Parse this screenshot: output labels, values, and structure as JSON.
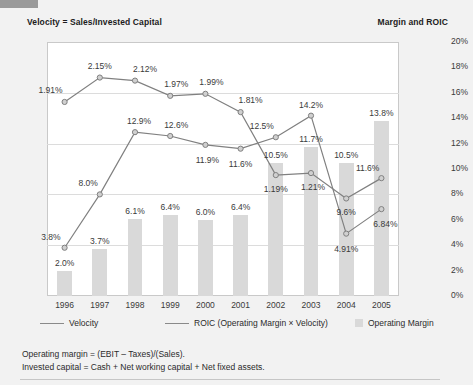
{
  "axis_titles": {
    "left": "Velocity = Sales/Invested Capital",
    "right": "Margin and ROIC"
  },
  "legend": [
    {
      "label": "Velocity",
      "marker": "line"
    },
    {
      "label": "ROIC (Operating Margin × Velocity)",
      "marker": "line"
    },
    {
      "label": "Operating Margin",
      "marker": "swatch"
    }
  ],
  "notes": [
    "Operating margin = (EBIT – Taxes)/(Sales).",
    "Invested capital = Cash + Net working capital + Net fixed assets."
  ],
  "colors": {
    "page_background": "#f2f2f2",
    "plot_background": "#ffffff",
    "bar": "#d9d9d9",
    "line": "#808080",
    "gridline": "#dcdcdc",
    "text": "#2b2b2b"
  },
  "chart_data": {
    "type": "bar",
    "title": "",
    "subtitle": "",
    "xlabel": "",
    "ylabel": "Velocity = Sales/Invested Capital",
    "y2label": "Margin and ROIC",
    "grid": true,
    "legend_position": "bottom",
    "categories": [
      "1996",
      "1997",
      "1998",
      "1999",
      "2000",
      "2001",
      "2002",
      "2003",
      "2004",
      "2005"
    ],
    "ylim": [
      0.0,
      2.5
    ],
    "yticks": [
      "0.0",
      "0.5",
      "1.0",
      "1.5",
      "2.0",
      "2.5"
    ],
    "ytick_values": [
      0.0,
      0.5,
      1.0,
      1.5,
      2.0,
      2.5
    ],
    "y2lim": [
      0,
      20
    ],
    "y2ticks": [
      "0%",
      "2%",
      "4%",
      "6%",
      "8%",
      "10%",
      "12%",
      "14%",
      "16%",
      "18%",
      "20%"
    ],
    "y2tick_values": [
      0,
      2,
      4,
      6,
      8,
      10,
      12,
      14,
      16,
      18,
      20
    ],
    "series": [
      {
        "name": "Operating Margin",
        "type": "bar",
        "axis": "right",
        "unit": "%",
        "values": [
          2.0,
          3.7,
          6.1,
          6.4,
          6.0,
          6.4,
          10.5,
          11.7,
          10.5,
          13.8
        ],
        "labels": [
          "2.0%",
          "3.7%",
          "6.1%",
          "6.4%",
          "6.0%",
          "6.4%",
          "10.5%",
          "11.7%",
          "10.5%",
          "13.8%"
        ]
      },
      {
        "name": "Velocity",
        "type": "line",
        "axis": "left",
        "unit": "",
        "values": [
          1.91,
          2.15,
          2.12,
          1.97,
          1.99,
          1.81,
          1.19,
          1.21,
          0.96,
          1.16
        ],
        "labels": [
          "1.91%",
          "2.15%",
          "2.12%",
          "1.97%",
          "1.99%",
          "1.81%",
          "1.19%",
          "1.21%",
          "9.6%",
          "11.6%"
        ]
      },
      {
        "name": "ROIC (Operating Margin × Velocity)",
        "type": "line",
        "axis": "right",
        "unit": "%",
        "values": [
          3.8,
          8.0,
          12.9,
          12.6,
          11.9,
          11.6,
          12.5,
          14.2,
          4.91,
          6.84
        ],
        "labels": [
          "3.8%",
          "8.0%",
          "12.9%",
          "12.6%",
          "11.9%",
          "11.6%",
          "12.5%",
          "14.2%",
          "4.91%",
          "6.84%"
        ]
      }
    ]
  }
}
